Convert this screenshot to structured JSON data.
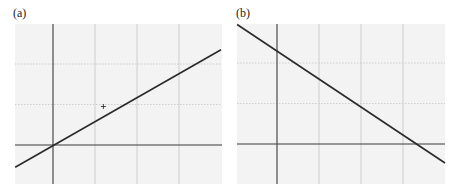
{
  "figure": {
    "colors": {
      "background": "#ffffff",
      "plot_area": "#f3f3f3",
      "grid": "#c4c4c4",
      "axis": "#3a3a3a",
      "line": "#2a2a2a",
      "marker": "#333333"
    }
  },
  "chart_data": [
    {
      "type": "line",
      "panel_label": "(a)",
      "title": "",
      "xlabel": "",
      "ylabel": "",
      "grid": true,
      "xlim": [
        -0.9,
        4.0
      ],
      "ylim": [
        -0.95,
        3.0
      ],
      "x_gridlines": [
        0,
        1,
        2,
        3
      ],
      "y_gridlines": [
        0,
        1,
        2
      ],
      "series": [
        {
          "name": "line",
          "x": [
            -0.9,
            4.0
          ],
          "y": [
            -0.55,
            2.35
          ]
        }
      ],
      "markers": [
        {
          "symbol": "+",
          "x": 1.2,
          "y": 0.95
        }
      ],
      "layout": {
        "left": 15,
        "top": 24,
        "width": 207,
        "height": 160,
        "origin_px": [
          53,
          145
        ],
        "unit_px": [
          42,
          40.5
        ]
      }
    },
    {
      "type": "line",
      "panel_label": "(b)",
      "title": "",
      "xlabel": "",
      "ylabel": "",
      "grid": true,
      "xlim": [
        -0.95,
        4.0
      ],
      "ylim": [
        -0.95,
        3.0
      ],
      "x_gridlines": [
        0,
        1,
        2,
        3
      ],
      "y_gridlines": [
        0,
        1,
        2
      ],
      "series": [
        {
          "name": "line",
          "x": [
            -0.95,
            4.0
          ],
          "y": [
            2.95,
            -0.47
          ]
        }
      ],
      "markers": [],
      "layout": {
        "left": 237,
        "top": 24,
        "width": 208,
        "height": 160,
        "origin_px": [
          277,
          144
        ],
        "unit_px": [
          42,
          40.5
        ]
      }
    }
  ]
}
